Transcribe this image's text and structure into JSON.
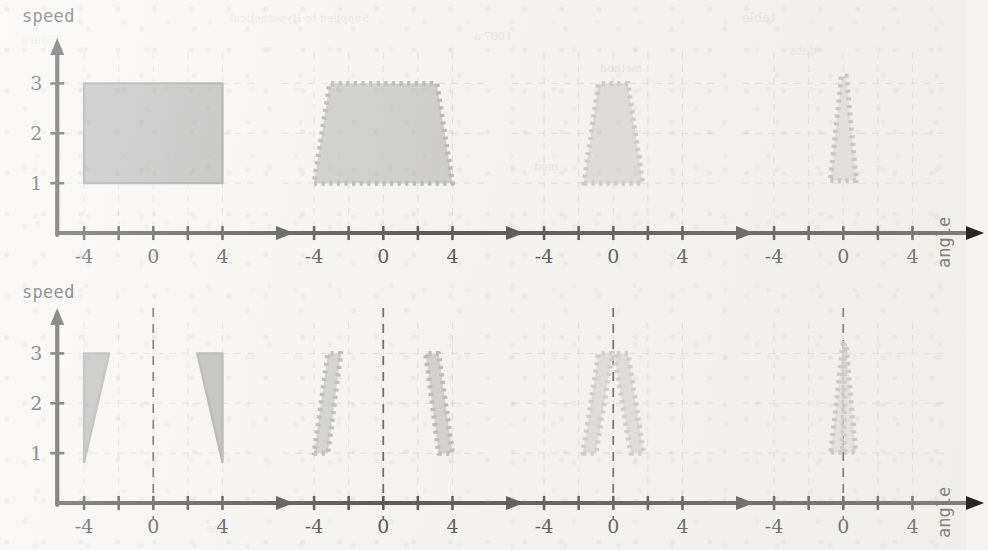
{
  "figure": {
    "background_color": "#f4f3f0",
    "axis_color": "#272727",
    "grid_color": "#cfd4dc",
    "rows": 2,
    "cols": 4,
    "y_axis_label": "speed",
    "x_axis_label": "angle",
    "x_ticks": [
      -4,
      -2,
      0,
      2,
      4
    ],
    "x_tick_labels": [
      "-4",
      "",
      "0",
      "",
      "4"
    ],
    "y_ticks": [
      1,
      2,
      3
    ],
    "y_tick_labels": [
      "1",
      "2",
      "3"
    ],
    "xlim": [
      -6.2,
      6.4
    ],
    "ylim": [
      0,
      3.55
    ]
  },
  "chart_data": {
    "type": "area",
    "title": "",
    "xlabel": "angle",
    "ylabel": "speed",
    "xlim": [
      -6.2,
      6.4
    ],
    "ylim": [
      0,
      3.55
    ],
    "xticks": [
      -4,
      -2,
      0,
      2,
      4
    ],
    "xticklabels": [
      "-4",
      "",
      "0",
      "",
      "4"
    ],
    "yticks": [
      1,
      2,
      3
    ],
    "yticklabels": [
      "1",
      "2",
      "3"
    ],
    "grid": "dashed-light",
    "legend": "none",
    "panels": [
      {
        "row": 0,
        "col": 0,
        "shows_y_axis": true,
        "shows_center_line": false,
        "fill_color": "#aaaaaa",
        "fill_opacity": 1.0,
        "edge_style": "solid",
        "edge_color": "#8e8e8e",
        "regions": [
          {
            "name": "full-box",
            "points": [
              [
                -4,
                1
              ],
              [
                4,
                1
              ],
              [
                4,
                3
              ],
              [
                -4,
                3
              ]
            ]
          }
        ]
      },
      {
        "row": 0,
        "col": 1,
        "shows_y_axis": false,
        "shows_center_line": false,
        "fill_color": "#bcbcbc",
        "fill_opacity": 0.95,
        "edge_style": "dotted",
        "edge_color": "#a6a6a6",
        "regions": [
          {
            "name": "wide-trapezoid",
            "points": [
              [
                -4,
                1
              ],
              [
                4,
                1
              ],
              [
                3.1,
                3
              ],
              [
                -3.1,
                3
              ]
            ]
          }
        ]
      },
      {
        "row": 0,
        "col": 2,
        "shows_y_axis": false,
        "shows_center_line": false,
        "fill_color": "#cfcfcf",
        "fill_opacity": 0.9,
        "edge_style": "dotted",
        "edge_color": "#bdbdbd",
        "regions": [
          {
            "name": "narrow-trapezoid",
            "points": [
              [
                -1.7,
                1
              ],
              [
                1.7,
                1
              ],
              [
                0.85,
                3
              ],
              [
                -0.85,
                3
              ]
            ]
          }
        ]
      },
      {
        "row": 0,
        "col": 3,
        "shows_y_axis": false,
        "shows_center_line": false,
        "fill_color": "#d4d4d4",
        "fill_opacity": 0.85,
        "edge_style": "dotted",
        "edge_color": "#b3b3b3",
        "regions": [
          {
            "name": "cone",
            "points": [
              [
                -0.75,
                1.05
              ],
              [
                0.75,
                1.05
              ],
              [
                0.18,
                3.15
              ],
              [
                -0.1,
                3.15
              ]
            ]
          }
        ]
      },
      {
        "row": 1,
        "col": 0,
        "shows_y_axis": true,
        "shows_center_line": true,
        "fill_color": "#a9a9a9",
        "fill_opacity": 1.0,
        "edge_style": "solid",
        "edge_color": "#9a9a9a",
        "regions": [
          {
            "name": "left-sliver",
            "points": [
              [
                -4,
                0.82
              ],
              [
                -4,
                3
              ],
              [
                -2.55,
                3
              ]
            ]
          },
          {
            "name": "right-sliver",
            "points": [
              [
                4,
                0.82
              ],
              [
                2.55,
                3
              ],
              [
                4,
                3
              ]
            ]
          }
        ]
      },
      {
        "row": 1,
        "col": 1,
        "shows_y_axis": false,
        "shows_center_line": true,
        "fill_color": "#c3c3c3",
        "fill_opacity": 0.95,
        "edge_style": "dotted",
        "edge_color": "#ababab",
        "regions": [
          {
            "name": "left-band",
            "points": [
              [
                -4,
                1
              ],
              [
                -3.2,
                1
              ],
              [
                -2.45,
                3
              ],
              [
                -3.2,
                3
              ]
            ]
          },
          {
            "name": "right-band",
            "points": [
              [
                3.2,
                1
              ],
              [
                4,
                1
              ],
              [
                3.2,
                3
              ],
              [
                2.45,
                3
              ]
            ]
          }
        ]
      },
      {
        "row": 1,
        "col": 2,
        "shows_y_axis": false,
        "shows_center_line": true,
        "fill_color": "#d2d2d2",
        "fill_opacity": 0.9,
        "edge_style": "dotted",
        "edge_color": "#c0c0c0",
        "regions": [
          {
            "name": "left-band",
            "points": [
              [
                -1.75,
                1
              ],
              [
                -1.0,
                1
              ],
              [
                -0.05,
                3
              ],
              [
                -0.85,
                3
              ]
            ]
          },
          {
            "name": "right-band",
            "points": [
              [
                1.0,
                1
              ],
              [
                1.75,
                1
              ],
              [
                0.85,
                3
              ],
              [
                0.05,
                3
              ]
            ]
          }
        ]
      },
      {
        "row": 1,
        "col": 3,
        "shows_y_axis": false,
        "shows_center_line": true,
        "fill_color": "#d6d6d6",
        "fill_opacity": 0.85,
        "edge_style": "dotted",
        "edge_color": "#b6b6b6",
        "regions": [
          {
            "name": "left-cone",
            "points": [
              [
                -0.72,
                1.02
              ],
              [
                -0.04,
                1.02
              ],
              [
                0.1,
                3.2
              ],
              [
                -0.02,
                3.2
              ]
            ]
          },
          {
            "name": "right-cone",
            "points": [
              [
                0.04,
                1.02
              ],
              [
                0.72,
                1.02
              ],
              [
                0.16,
                3.2
              ],
              [
                0.06,
                3.2
              ]
            ]
          }
        ]
      }
    ]
  },
  "bleedthrough": [
    {
      "text": "Supplied to Hypothetical",
      "x": 230,
      "y": 12
    },
    {
      "text": "table",
      "x": 742,
      "y": 10
    },
    {
      "text": "Figure",
      "x": 22,
      "y": 34
    },
    {
      "text": "method",
      "x": 600,
      "y": 62
    },
    {
      "text": "1007 a",
      "x": 474,
      "y": 30
    },
    {
      "text": "mod",
      "x": 534,
      "y": 160
    },
    {
      "text": "data",
      "x": 790,
      "y": 44
    },
    {
      "text": "the",
      "x": 206,
      "y": 522
    }
  ]
}
